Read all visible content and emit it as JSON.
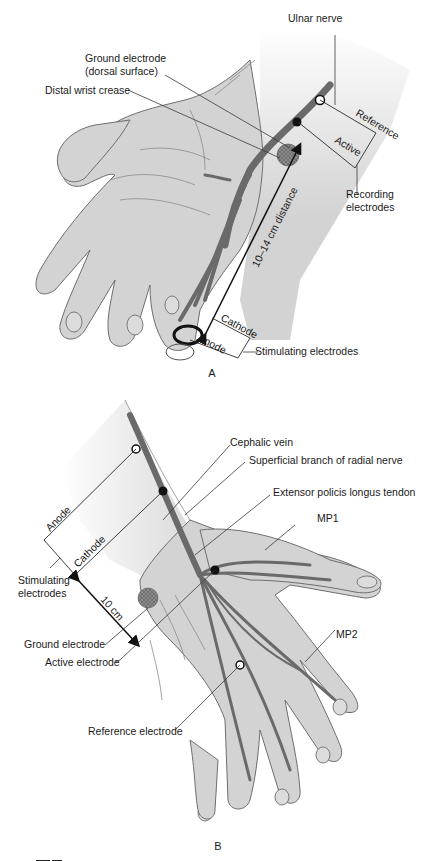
{
  "figure": {
    "panel_a": {
      "panel_label": "A",
      "labels": {
        "ulnar_nerve": "Ulnar nerve",
        "ground_electrode_line1": "Ground electrode",
        "ground_electrode_line2": "(dorsal surface)",
        "distal_wrist_crease": "Distal wrist crease",
        "reference": "Reference",
        "active": "Active",
        "recording_line1": "Recording",
        "recording_line2": "electrodes",
        "distance": "10–14 cm distance",
        "cathode": "Cathode",
        "anode": "Anode",
        "stimulating": "Stimulating electrodes"
      }
    },
    "panel_b": {
      "panel_label": "B",
      "labels": {
        "cephalic_vein": "Cephalic vein",
        "superficial_branch": "Superficial branch of radial nerve",
        "epl_tendon": "Extensor policis longus tendon",
        "mp1": "MP1",
        "mp2": "MP2",
        "anode": "Anode",
        "cathode": "Cathode",
        "stimulating_line1": "Stimulating",
        "stimulating_line2": "electrodes",
        "distance": "10 cm",
        "ground_electrode": "Ground electrode",
        "active_electrode": "Active electrode",
        "reference_electrode": "Reference electrode"
      }
    },
    "colors": {
      "skin": "#d3d3d3",
      "outline": "#6e6e6e",
      "nerve": "#6a6a6a",
      "text": "#1a1a1a",
      "ground_pad": "#8c8c8c"
    }
  }
}
